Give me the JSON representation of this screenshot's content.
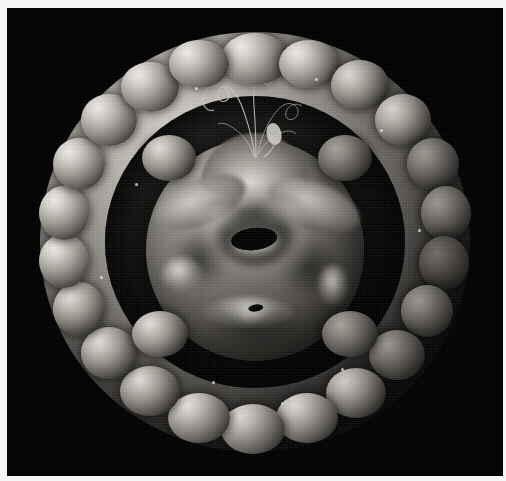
{
  "image": {
    "kind": "scanning-electron-micrograph",
    "title": "Scanning electron micrograph of a spherical microfossil specimen",
    "subject": "spherical shelled microorganism with lobed outer wall and inner body",
    "modality": "SEM",
    "color_mode": "grayscale",
    "width_px": 506,
    "height_px": 481,
    "background_color": "#000000",
    "border_color": "#f6f6f5",
    "highlight_color": "#e8e5e0",
    "midtone_color": "#8a8780",
    "shadow_color": "#141413",
    "lighting_direction": "upper-left"
  },
  "specimen": {
    "outer_shell": {
      "label": "outer lobed shell ring",
      "shape": "annulus of rounded nodules",
      "lobe_count": 26,
      "outer_diameter_px": 430,
      "inner_opening_px": 300
    },
    "inner_body": {
      "label": "inner spherical body",
      "diameter_px": 220,
      "features": [
        "apical ridge at top",
        "central elongated pore",
        "raised annulus around central pore",
        "small secondary pore at lower centre",
        "bright specular blotches on left and right flanks"
      ]
    },
    "filaments": {
      "label": "thin wavy filaments at apex",
      "count": 5,
      "description": "hair-like threads extending upward from the apex, one ending in a small bulb"
    }
  },
  "lobes": [
    {
      "cx": 50.0,
      "cy": 6.5,
      "w": 68,
      "h": 52,
      "tone": "bright"
    },
    {
      "cx": 62.5,
      "cy": 7.5,
      "w": 60,
      "h": 48,
      "tone": "bright"
    },
    {
      "cx": 74.5,
      "cy": 12.5,
      "w": 58,
      "h": 50,
      "tone": "normal"
    },
    {
      "cx": 84.5,
      "cy": 21.0,
      "w": 56,
      "h": 52,
      "tone": "normal"
    },
    {
      "cx": 91.5,
      "cy": 31.5,
      "w": 52,
      "h": 52,
      "tone": "dim"
    },
    {
      "cx": 94.5,
      "cy": 43.0,
      "w": 50,
      "h": 54,
      "tone": "dim"
    },
    {
      "cx": 94.0,
      "cy": 55.0,
      "w": 50,
      "h": 54,
      "tone": "dark"
    },
    {
      "cx": 90.0,
      "cy": 66.5,
      "w": 52,
      "h": 52,
      "tone": "dim"
    },
    {
      "cx": 83.0,
      "cy": 77.0,
      "w": 56,
      "h": 50,
      "tone": "dim"
    },
    {
      "cx": 73.5,
      "cy": 86.0,
      "w": 60,
      "h": 50,
      "tone": "normal"
    },
    {
      "cx": 62.0,
      "cy": 92.0,
      "w": 62,
      "h": 50,
      "tone": "bright"
    },
    {
      "cx": 49.5,
      "cy": 94.5,
      "w": 64,
      "h": 50,
      "tone": "bright"
    },
    {
      "cx": 37.0,
      "cy": 92.0,
      "w": 62,
      "h": 50,
      "tone": "bright"
    },
    {
      "cx": 25.5,
      "cy": 85.5,
      "w": 60,
      "h": 50,
      "tone": "normal"
    },
    {
      "cx": 16.0,
      "cy": 76.5,
      "w": 56,
      "h": 52,
      "tone": "normal"
    },
    {
      "cx": 9.0,
      "cy": 66.0,
      "w": 52,
      "h": 54,
      "tone": "normal"
    },
    {
      "cx": 5.5,
      "cy": 54.5,
      "w": 50,
      "h": 54,
      "tone": "bright"
    },
    {
      "cx": 5.5,
      "cy": 43.0,
      "w": 50,
      "h": 54,
      "tone": "bright"
    },
    {
      "cx": 9.0,
      "cy": 31.5,
      "w": 52,
      "h": 52,
      "tone": "bright"
    },
    {
      "cx": 16.0,
      "cy": 21.0,
      "w": 56,
      "h": 52,
      "tone": "bright"
    },
    {
      "cx": 25.5,
      "cy": 13.0,
      "w": 58,
      "h": 50,
      "tone": "bright"
    },
    {
      "cx": 37.0,
      "cy": 7.5,
      "w": 60,
      "h": 48,
      "tone": "bright"
    },
    {
      "cx": 30.0,
      "cy": 30.0,
      "w": 54,
      "h": 46,
      "tone": "normal"
    },
    {
      "cx": 71.0,
      "cy": 30.0,
      "w": 54,
      "h": 46,
      "tone": "dim"
    },
    {
      "cx": 28.0,
      "cy": 72.0,
      "w": 56,
      "h": 46,
      "tone": "normal"
    },
    {
      "cx": 72.0,
      "cy": 72.0,
      "w": 56,
      "h": 46,
      "tone": "dim"
    }
  ],
  "specks": [
    {
      "x": 36.0,
      "y": 13.0
    },
    {
      "x": 64.0,
      "y": 11.0
    },
    {
      "x": 79.0,
      "y": 23.0
    },
    {
      "x": 22.0,
      "y": 36.0
    },
    {
      "x": 88.0,
      "y": 47.0
    },
    {
      "x": 14.0,
      "y": 58.0
    },
    {
      "x": 56.0,
      "y": 88.0
    },
    {
      "x": 40.0,
      "y": 83.0
    },
    {
      "x": 70.0,
      "y": 80.0
    }
  ]
}
